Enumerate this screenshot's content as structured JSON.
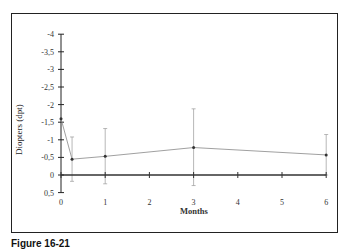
{
  "chart_data": {
    "type": "line",
    "title": "",
    "xlabel": "Months",
    "ylabel": "Diopters (dpt)",
    "x_ticks": [
      "0",
      "1",
      "2",
      "3",
      "4",
      "5",
      "6"
    ],
    "y_ticks": [
      "-4",
      "-3,5",
      "-3",
      "-2,5",
      "-2",
      "-1,5",
      "-1",
      "-0,5",
      "0",
      "0,5"
    ],
    "ylim": [
      0.5,
      -4
    ],
    "xlim": [
      0,
      6
    ],
    "y_inverted": true,
    "grid": false,
    "series": [
      {
        "name": "treated",
        "x": [
          0,
          0.25,
          1,
          3,
          6
        ],
        "values": [
          -1.6,
          -0.45,
          -0.53,
          -0.78,
          -0.57
        ],
        "error_low": [
          null,
          0.18,
          0.25,
          0.3,
          0.0
        ],
        "error_high": [
          null,
          -1.08,
          -1.32,
          -1.88,
          -1.15
        ],
        "color": "#888888"
      },
      {
        "name": "baseline",
        "x": [
          0,
          1,
          2,
          3,
          4,
          5,
          6
        ],
        "values": [
          0,
          0,
          0,
          0,
          0,
          0,
          0
        ],
        "color": "#333333"
      }
    ]
  },
  "caption": "Figure 16-21"
}
